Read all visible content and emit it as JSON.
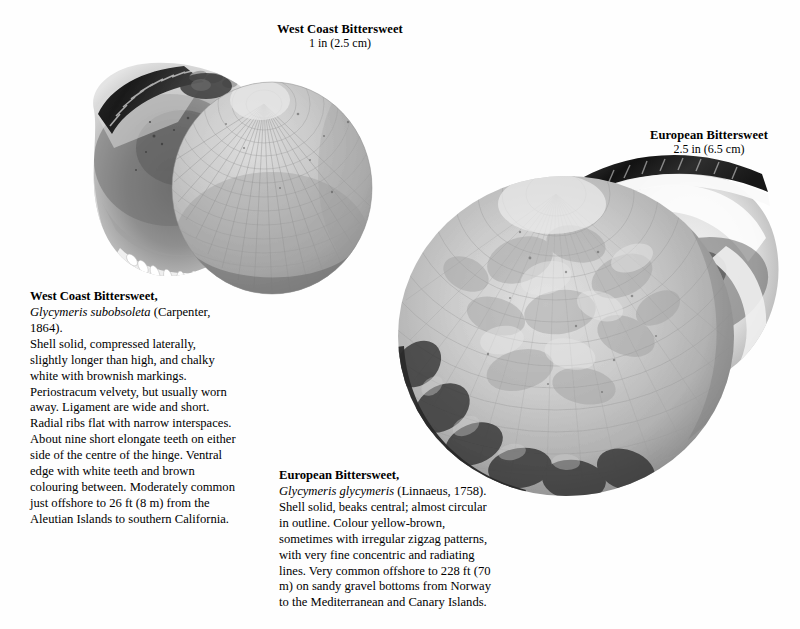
{
  "page": {
    "background_color": "#fefefe",
    "text_color": "#000000"
  },
  "specimens": [
    {
      "id": "west-coast-bittersweet",
      "caption_name": "West Coast Bittersweet",
      "caption_size": "1 in (2.5 cm)",
      "title": "West Coast Bittersweet,",
      "scientific_name": "Glycymeris subobsoleta",
      "authority": " (Carpenter, 1864).",
      "description": "Shell solid, compressed laterally, slightly longer than high, and chalky white with brownish markings. Periostracum velvety, but usually worn away. Ligament are wide and short. Radial ribs flat with narrow interspaces. About nine short elongate teeth on either side of the centre of the hinge. Ventral edge with white teeth and brown colouring between. Moderately common just offshore to 26 ft (8 m) from the Aleutian Islands to southern California.",
      "photo_alt": "Two valves of West Coast Bittersweet: left valve showing white crenulated interior with dark hinge teeth, right valve showing ribbed exterior"
    },
    {
      "id": "european-bittersweet",
      "caption_name": "European Bittersweet",
      "caption_size": "2.5 in (6.5 cm)",
      "title": "European Bittersweet,",
      "scientific_name": "Glycymeris glycymeris",
      "authority": " (Linnaeus, 1758).",
      "description": "Shell solid, beaks central; almost circular in outline. Colour yellow-brown, sometimes with irregular zigzag patterns, with very fine concentric and radiating lines. Very common offshore to 228 ft  (70 m) on sandy gravel bottoms from Norway to the Mediterranean and Canary Islands.",
      "photo_alt": "Large rounded European Bittersweet valve with mottled zigzag markings and dark periostracum band, with a second valve behind"
    }
  ]
}
